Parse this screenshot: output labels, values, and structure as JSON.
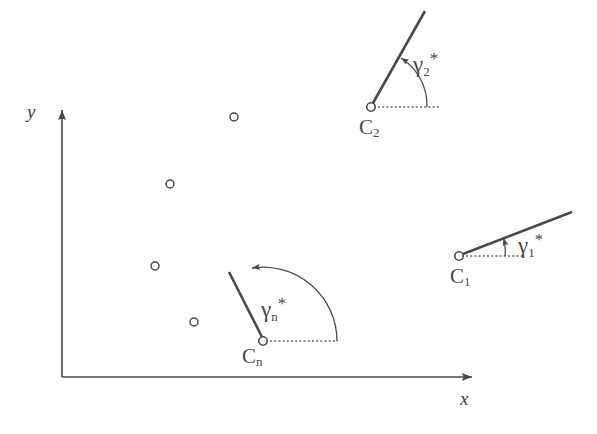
{
  "figure": {
    "type": "technical-diagram",
    "background_color": "#ffffff",
    "stroke_color": "#4a4a4a",
    "axes": {
      "x_label": "x",
      "y_label": "y",
      "origin": [
        62,
        377
      ],
      "x_axis_tip": [
        487,
        377
      ],
      "y_axis_tip": [
        62,
        95
      ],
      "x_label_pos": [
        461,
        390
      ],
      "y_label_pos": [
        30,
        104
      ]
    },
    "points": [
      {
        "name": "point-1",
        "cx": 234,
        "cy": 117,
        "r": 4
      },
      {
        "name": "point-2",
        "cx": 170,
        "cy": 184,
        "r": 4
      },
      {
        "name": "point-3",
        "cx": 155,
        "cy": 266,
        "r": 4
      },
      {
        "name": "point-4",
        "cx": 194,
        "cy": 322,
        "r": 4
      }
    ],
    "clusters": [
      {
        "id": "c1",
        "label": "C",
        "subscript": "1",
        "angle_label": "γ",
        "angle_subscript": "1",
        "angle_superscript": "*",
        "angle_deg": 21,
        "vertex": [
          459,
          256
        ],
        "line_end": [
          572,
          212
        ],
        "ref_line_end": [
          523,
          256
        ],
        "arc_radius": 46,
        "label_pos": [
          451,
          266
        ],
        "angle_label_pos": [
          519,
          233
        ]
      },
      {
        "id": "c2",
        "label": "C",
        "subscript": "2",
        "angle_label": "γ",
        "angle_subscript": "2",
        "angle_superscript": "*",
        "angle_deg": 62,
        "vertex": [
          371,
          107
        ],
        "line_end": [
          425,
          11
        ],
        "ref_line_end": [
          441,
          107
        ],
        "arc_radius": 56,
        "label_pos": [
          360,
          117
        ],
        "angle_label_pos": [
          414,
          52
        ]
      },
      {
        "id": "cn",
        "label": "C",
        "subscript": "n",
        "angle_label": "γ",
        "angle_subscript": "n",
        "angle_superscript": "*",
        "angle_deg": 115,
        "vertex": [
          263,
          341
        ],
        "line_end": [
          229,
          272
        ],
        "ref_line_end": [
          338,
          341
        ],
        "arc_radius": 74,
        "label_pos": [
          243,
          346
        ],
        "angle_label_pos": [
          262,
          297
        ]
      }
    ]
  }
}
